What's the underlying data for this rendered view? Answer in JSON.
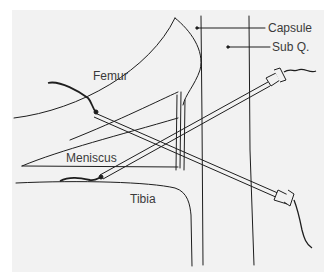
{
  "diagram": {
    "type": "anatomical-illustration",
    "labels": {
      "capsule": "Capsule",
      "sub_q": "Sub Q.",
      "femur": "Femur",
      "meniscus": "Meniscus",
      "tibia": "Tibia"
    },
    "colors": {
      "background": "#f2f2f2",
      "line": "#1e1e1e",
      "text": "#3a3a3a"
    }
  }
}
